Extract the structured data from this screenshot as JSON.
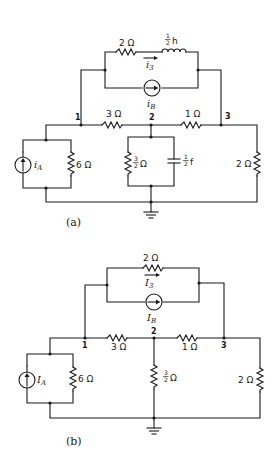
{
  "figure": {
    "panels": [
      {
        "id": "a",
        "caption": "(a)",
        "nodes": [
          "1",
          "2",
          "3"
        ],
        "components": {
          "top_resistor": "2 Ω",
          "inductor": "h",
          "inductor_frac": {
            "num": "1",
            "den": "2"
          },
          "top_current": "i",
          "top_current_sub": "3",
          "source_b": "i",
          "source_b_sub": "B",
          "r_1_2": "3 Ω",
          "r_2_3": "1 Ω",
          "source_a": "i",
          "source_a_sub": "A",
          "r_left": "6 Ω",
          "r_mid_frac": {
            "num": "3",
            "den": "2"
          },
          "r_mid_unit": "Ω",
          "capacitor": "f",
          "capacitor_frac": {
            "num": "1",
            "den": "2"
          },
          "r_right": "2 Ω"
        }
      },
      {
        "id": "b",
        "caption": "(b)",
        "nodes": [
          "1",
          "2",
          "3"
        ],
        "components": {
          "top_resistor": "2 Ω",
          "top_current": "I",
          "top_current_sub": "3",
          "source_b": "I",
          "source_b_sub": "B",
          "r_1_2": "3 Ω",
          "r_2_3": "1 Ω",
          "source_a": "I",
          "source_a_sub": "A",
          "r_left": "6 Ω",
          "r_mid_frac": {
            "num": "3",
            "den": "2"
          },
          "r_mid_unit": "Ω",
          "r_right": "2 Ω"
        }
      }
    ]
  }
}
